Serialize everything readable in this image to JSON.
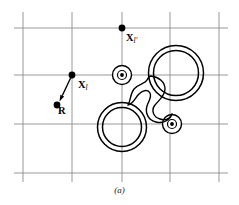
{
  "figure": {
    "caption": "(a)",
    "background_color": "#ffffff",
    "grid_color": "#8c8c8c",
    "ink_color": "#000000",
    "labels": {
      "x_l_prime": {
        "symbol": "X",
        "subscript": "l'",
        "x": 122,
        "y": 28
      },
      "x_l": {
        "symbol": "X",
        "subscript": "l",
        "x": 72,
        "y": 75
      },
      "r": {
        "symbol": "R",
        "subscript": "",
        "x": 57,
        "y": 105
      }
    },
    "grid": {
      "vertical_x": [
        23,
        72,
        122,
        170,
        219
      ],
      "horizontal_y": [
        28,
        75,
        124,
        173
      ],
      "x_min": 14,
      "x_max": 228,
      "y_min": 12,
      "y_max": 182,
      "stroke_width": 0.9
    },
    "points": [
      {
        "name": "x-l-prime-point",
        "x": 122,
        "y": 28,
        "r": 3.4
      },
      {
        "name": "x-l-point",
        "x": 72,
        "y": 75,
        "r": 3.4
      },
      {
        "name": "r-point",
        "x": 57,
        "y": 105,
        "r": 3.4
      }
    ],
    "arrow": {
      "name": "displacement-arrow",
      "from_x": 72,
      "from_y": 75,
      "to_x": 59.5,
      "to_y": 101.5,
      "head_length": 6.5,
      "head_width": 4.2
    },
    "scatterers": [
      {
        "name": "large-annulus-upper-right",
        "type": "annulus",
        "cx": 176,
        "cy": 73,
        "r_outer": 27.5,
        "r_inner": 22.5
      },
      {
        "name": "large-annulus-lower-left",
        "type": "annulus",
        "cx": 122,
        "cy": 127,
        "r_outer": 24.5,
        "r_inner": 19.5
      },
      {
        "name": "small-target-upper",
        "type": "target",
        "cx": 122,
        "cy": 75,
        "r_outer": 9.5,
        "r_inner": 4.5,
        "r_dot": 1.9
      },
      {
        "name": "small-target-lower",
        "type": "target",
        "cx": 172,
        "cy": 124,
        "r_outer": 9.5,
        "r_inner": 4.5,
        "r_dot": 1.9
      },
      {
        "name": "irregular-blob",
        "type": "blob"
      }
    ],
    "blob_path": "M 151 76 C 159 77, 165 82, 165 89 C 165 96, 159 100, 155 105 C 151 110, 153 117, 160 119 C 166 121, 170 118, 172 114 C 170 120, 163 124, 156 122 C 148 120, 145 113, 147 106 C 149 100, 152 97, 150 93 C 148 89, 143 90, 139 94 C 135 98, 133 104, 128 105 C 131 100, 130 94, 134 89 C 138 84, 145 84, 147 80 C 148 78, 149 76, 151 76 Z"
  }
}
